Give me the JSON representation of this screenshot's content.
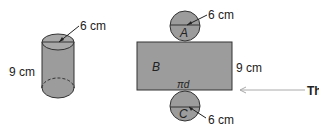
{
  "cylinder": {
    "radius_label": "6 cm",
    "height_label": "9 cm"
  },
  "net": {
    "top_circle": {
      "label": "A",
      "radius_label": "6 cm"
    },
    "rectangle": {
      "label": "B",
      "height_label": "9 cm",
      "width_label": "πd"
    },
    "bottom_circle": {
      "label": "C",
      "radius_label": "6 cm"
    }
  },
  "arrow_text": "Th",
  "colors": {
    "fill": "#9c9c9c",
    "stroke": "#333333",
    "arrow": "#aaaaaa"
  }
}
